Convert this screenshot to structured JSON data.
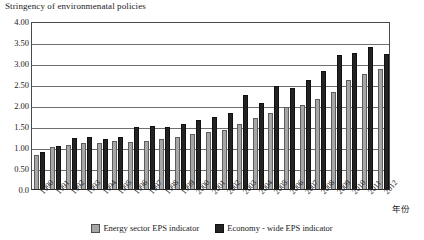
{
  "chart_data": {
    "type": "bar",
    "title": "Stringency of environmenatal policies",
    "xlabel": "年份",
    "ylabel": "",
    "ylim": [
      0,
      4.0
    ],
    "ytick_labels": [
      "4.00",
      "3.50",
      "3.00",
      "2.50",
      "2.00",
      "1.50",
      "1.00",
      "0.50",
      "0.0"
    ],
    "ytick_values": [
      4.0,
      3.5,
      3.0,
      2.5,
      2.0,
      1.5,
      1.0,
      0.5,
      0.0
    ],
    "grid": true,
    "legend_position": "bottom",
    "categories": [
      "1990",
      "1991",
      "1992",
      "1993",
      "1994",
      "1995",
      "1996",
      "1997",
      "1998",
      "1999",
      "2000",
      "2001",
      "2002",
      "2003",
      "2004",
      "2005",
      "2006",
      "2007",
      "2008",
      "2009",
      "2010",
      "2011",
      "2012"
    ],
    "series": [
      {
        "name": "Energy sector EPS indicator",
        "color": "#a6a6a6",
        "values": [
          0.8,
          1.0,
          1.05,
          1.1,
          1.1,
          1.15,
          1.12,
          1.15,
          1.2,
          1.25,
          1.3,
          1.35,
          1.4,
          1.55,
          1.7,
          1.8,
          1.95,
          2.0,
          2.15,
          2.3,
          2.6,
          2.75,
          2.85
        ]
      },
      {
        "name": "Economy - wide EPS indicator",
        "color": "#232323",
        "values": [
          0.88,
          1.02,
          1.22,
          1.25,
          1.2,
          1.25,
          1.48,
          1.5,
          1.47,
          1.55,
          1.65,
          1.72,
          1.8,
          2.25,
          2.05,
          2.45,
          2.4,
          2.6,
          2.8,
          3.2,
          3.25,
          3.38,
          3.22
        ]
      }
    ]
  }
}
